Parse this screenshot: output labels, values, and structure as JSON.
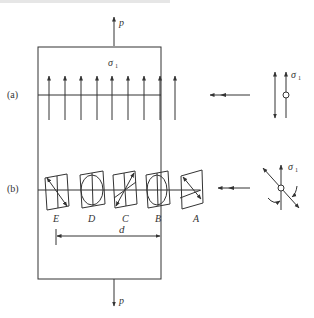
{
  "figure": {
    "top_caption_fragment": "",
    "load_label_top": "p",
    "load_label_bottom": "p",
    "stress_label": "σ₁",
    "stress_symbol": "σ",
    "stress_subscript": "1",
    "row_a_label": "(a)",
    "row_b_label": "(b)",
    "elements": [
      {
        "id": "E",
        "shape": "parallelogram-diagonal"
      },
      {
        "id": "D",
        "shape": "ellipse"
      },
      {
        "id": "C",
        "shape": "parallelogram-diagonal"
      },
      {
        "id": "B",
        "shape": "ellipse"
      },
      {
        "id": "A",
        "shape": "parallelogram-diagonal"
      }
    ],
    "dimension_label": "d",
    "colors": {
      "line": "#333333",
      "background": "#ffffff"
    }
  }
}
